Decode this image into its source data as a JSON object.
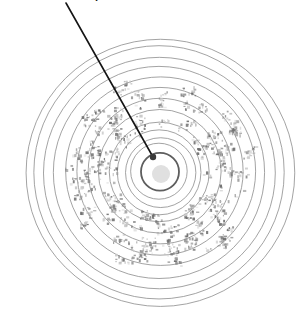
{
  "figure": {
    "title_fragment": "p",
    "background_color": "#ffffff",
    "center": {
      "x": 160,
      "y": 172
    },
    "colors": {
      "ring_stroke": "#8c8c8c",
      "ring_stroke_bold": "#5e5e5e",
      "center_dot_fill": "#e0e0e0",
      "speckle_dark": "#6f6f6f",
      "speckle_mid": "#9a9a9a",
      "speckle_light": "#c9c9c9",
      "pointer_line": "#151515",
      "pointer_tip": "#3a3a3a",
      "label_text": "#1a1a1a"
    },
    "rings": {
      "count": 13,
      "unit": "px",
      "radii": [
        19,
        28,
        35,
        42,
        50,
        61,
        72,
        83,
        94,
        105,
        116,
        125,
        134
      ],
      "bold_ring_radius": 19,
      "stroke_width": 0.8,
      "bold_stroke_width": 1.8
    },
    "center_dot": {
      "cx": 161,
      "cy": 174,
      "r": 9,
      "fill": "#e0e0e0"
    },
    "speckle_band": {
      "inner_radius": 44,
      "outer_radius": 96,
      "blob_count": 150,
      "label": "speckled annulus"
    },
    "pointer": {
      "x1": 66,
      "y1": 3,
      "x2": 153,
      "y2": 157,
      "stroke_width": 1.6,
      "tip_radius": 3.2,
      "label": "pointer to center ring"
    },
    "cut_label": {
      "text": "p",
      "x": 95,
      "y": -9
    }
  }
}
